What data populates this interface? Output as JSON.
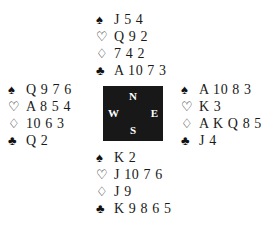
{
  "diagram": {
    "type": "bridge-deal",
    "suit_symbols": {
      "spades": "♠",
      "hearts": "♡",
      "diamonds": "♢",
      "clubs": "♣"
    },
    "compass": {
      "north": "N",
      "west": "W",
      "east": "E",
      "south": "S",
      "box_color": "#181818",
      "letter_color": "#ffffff"
    },
    "background_color": "#ffffff",
    "text_color": "#1a1a1a",
    "hands": {
      "north": {
        "label": "N",
        "spades": "J 5 4",
        "hearts": "Q 9 2",
        "diamonds": "7 4 2",
        "clubs": "A 10 7 3"
      },
      "west": {
        "label": "W",
        "spades": "Q 9 7 6",
        "hearts": "A 8 5 4",
        "diamonds": "10 6 3",
        "clubs": "Q 2"
      },
      "east": {
        "label": "E",
        "spades": "A 10 8 3",
        "hearts": "K 3",
        "diamonds": "A K Q 8 5",
        "clubs": "J 4"
      },
      "south": {
        "label": "S",
        "spades": "K 2",
        "hearts": "J 10 7 6",
        "diamonds": "J 9",
        "clubs": "K 9 8 6 5"
      }
    }
  }
}
